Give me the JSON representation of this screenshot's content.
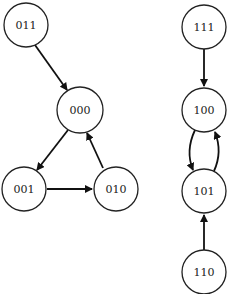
{
  "diagram": {
    "type": "state-transition-graph",
    "nodes": [
      {
        "id": "011",
        "label": "011",
        "x": 26,
        "y": 25
      },
      {
        "id": "000",
        "label": "000",
        "x": 80,
        "y": 110
      },
      {
        "id": "001",
        "label": "001",
        "x": 24,
        "y": 189
      },
      {
        "id": "010",
        "label": "010",
        "x": 116,
        "y": 189
      },
      {
        "id": "111",
        "label": "111",
        "x": 204,
        "y": 27
      },
      {
        "id": "100",
        "label": "100",
        "x": 204,
        "y": 110
      },
      {
        "id": "101",
        "label": "101",
        "x": 204,
        "y": 191
      },
      {
        "id": "110",
        "label": "110",
        "x": 204,
        "y": 272
      }
    ],
    "edges": [
      {
        "from": "011",
        "to": "000"
      },
      {
        "from": "000",
        "to": "001"
      },
      {
        "from": "001",
        "to": "010"
      },
      {
        "from": "010",
        "to": "000"
      },
      {
        "from": "111",
        "to": "100"
      },
      {
        "from": "100",
        "to": "101"
      },
      {
        "from": "101",
        "to": "100"
      },
      {
        "from": "110",
        "to": "101"
      }
    ],
    "colors": {
      "stroke": "#222222",
      "fill": "#ffffff"
    }
  }
}
